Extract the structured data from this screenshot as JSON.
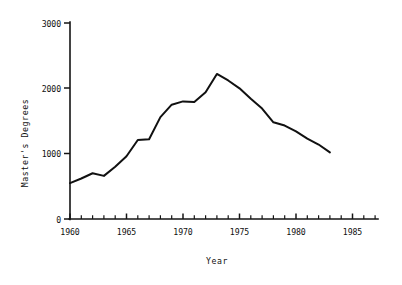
{
  "chart_data": {
    "type": "line",
    "title": "",
    "xlabel": "Year",
    "ylabel": "Master's Degrees",
    "xlim": [
      1960,
      1986
    ],
    "ylim": [
      0,
      3000
    ],
    "grid": false,
    "legend": null,
    "x_ticks_major": [
      1960,
      1965,
      1970,
      1975,
      1980,
      1985
    ],
    "x_tick_labels": [
      "1960",
      "1965",
      "1970",
      "1975",
      "1980",
      "1985"
    ],
    "x_minor_tick_step": 1,
    "y_ticks_major": [
      0,
      1000,
      2000,
      3000
    ],
    "y_tick_labels": [
      "0",
      "1000",
      "2000",
      "3000"
    ],
    "line_color": "#111111",
    "x": [
      1960,
      1961,
      1962,
      1963,
      1964,
      1965,
      1966,
      1967,
      1968,
      1969,
      1970,
      1971,
      1972,
      1973,
      1974,
      1975,
      1976,
      1977,
      1978,
      1979,
      1980,
      1981,
      1982,
      1983
    ],
    "values": [
      550,
      620,
      700,
      660,
      800,
      960,
      1210,
      1220,
      1560,
      1750,
      1800,
      1790,
      1940,
      2220,
      2120,
      2000,
      1840,
      1690,
      1480,
      1430,
      1340,
      1230,
      1140,
      1020
    ],
    "series": [
      {
        "name": "Master's Degrees",
        "values": [
          550,
          620,
          700,
          660,
          800,
          960,
          1210,
          1220,
          1560,
          1750,
          1800,
          1790,
          1940,
          2220,
          2120,
          2000,
          1840,
          1690,
          1480,
          1430,
          1340,
          1230,
          1140,
          1020
        ]
      }
    ]
  },
  "axes": {
    "y_title": "Master's Degrees",
    "x_title": "Year",
    "y_labels": {
      "t0": "0",
      "t1": "1000",
      "t2": "2000",
      "t3": "3000"
    },
    "x_labels": {
      "t0": "1960",
      "t1": "1965",
      "t2": "1970",
      "t3": "1975",
      "t4": "1980",
      "t5": "1985"
    }
  }
}
